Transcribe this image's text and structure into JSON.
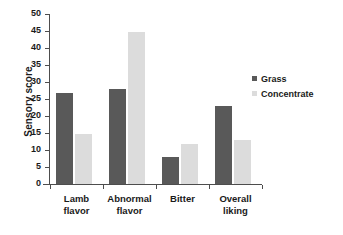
{
  "chart_data": {
    "type": "bar",
    "title": "",
    "subtitle": "",
    "xlabel": "",
    "ylabel": "Sensory score",
    "ylim": [
      0,
      50
    ],
    "ytick_interval": 5,
    "yticks": [
      0,
      5,
      10,
      15,
      20,
      25,
      30,
      35,
      40,
      45,
      50
    ],
    "categories": [
      "Lamb flavor",
      "Abnormal flavor",
      "Bitter",
      "Overall liking"
    ],
    "category_lines": [
      [
        "Lamb",
        "flavor"
      ],
      [
        "Abnormal",
        "flavor"
      ],
      [
        "Bitter"
      ],
      [
        "Overall",
        "liking"
      ]
    ],
    "series": [
      {
        "name": "Grass",
        "color": "#595959",
        "values": [
          26.7,
          27.8,
          7.9,
          22.9
        ]
      },
      {
        "name": "Concentrate",
        "color": "#dcdcdc",
        "values": [
          14.7,
          44.7,
          11.8,
          12.9
        ]
      }
    ],
    "grid": false,
    "legend_position": "right",
    "background": "#ffffff",
    "axis_color": "#4d4d4d",
    "text_color": "#1a1a1a"
  },
  "legend": {
    "items": [
      {
        "label": "Grass"
      },
      {
        "label": "Concentrate"
      }
    ]
  }
}
